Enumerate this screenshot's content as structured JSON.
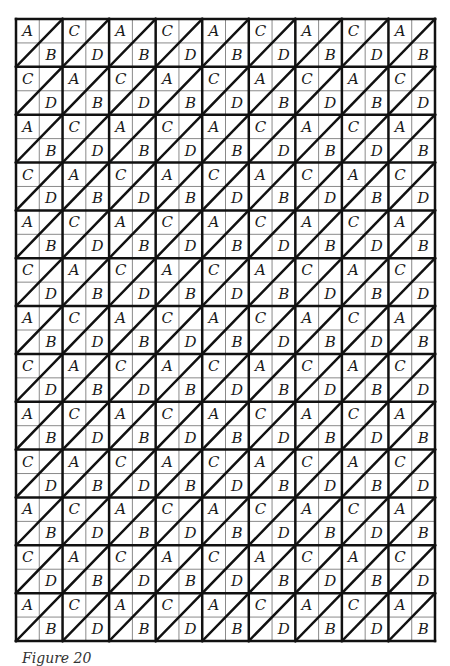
{
  "figure": {
    "caption": "Figure 20",
    "grid": {
      "block_columns": 9,
      "block_rows": 13,
      "cells_per_block": 2,
      "diagonal_direction": "bottom-left-to-top-right",
      "pattern_rule": "block (row,col): A/B when (row+col) even, C/D when odd",
      "letter_pairs": {
        "even": {
          "top_left": "A",
          "bottom_right": "B"
        },
        "odd": {
          "top_left": "C",
          "bottom_right": "D"
        }
      },
      "rows": [
        [
          "A/B",
          "C/D",
          "A/B",
          "C/D",
          "A/B",
          "C/D",
          "A/B",
          "C/D",
          "A/B"
        ],
        [
          "C/D",
          "A/B",
          "C/D",
          "A/B",
          "C/D",
          "A/B",
          "C/D",
          "A/B",
          "C/D"
        ],
        [
          "A/B",
          "C/D",
          "A/B",
          "C/D",
          "A/B",
          "C/D",
          "A/B",
          "C/D",
          "A/B"
        ],
        [
          "C/D",
          "A/B",
          "C/D",
          "A/B",
          "C/D",
          "A/B",
          "C/D",
          "A/B",
          "C/D"
        ],
        [
          "A/B",
          "C/D",
          "A/B",
          "C/D",
          "A/B",
          "C/D",
          "A/B",
          "C/D",
          "A/B"
        ],
        [
          "C/D",
          "A/B",
          "C/D",
          "A/B",
          "C/D",
          "A/B",
          "C/D",
          "A/B",
          "C/D"
        ],
        [
          "A/B",
          "C/D",
          "A/B",
          "C/D",
          "A/B",
          "C/D",
          "A/B",
          "C/D",
          "A/B"
        ],
        [
          "C/D",
          "A/B",
          "C/D",
          "A/B",
          "C/D",
          "A/B",
          "C/D",
          "A/B",
          "C/D"
        ],
        [
          "A/B",
          "C/D",
          "A/B",
          "C/D",
          "A/B",
          "C/D",
          "A/B",
          "C/D",
          "A/B"
        ],
        [
          "C/D",
          "A/B",
          "C/D",
          "A/B",
          "C/D",
          "A/B",
          "C/D",
          "A/B",
          "C/D"
        ],
        [
          "A/B",
          "C/D",
          "A/B",
          "C/D",
          "A/B",
          "C/D",
          "A/B",
          "C/D",
          "A/B"
        ],
        [
          "C/D",
          "A/B",
          "C/D",
          "A/B",
          "C/D",
          "A/B",
          "C/D",
          "A/B",
          "C/D"
        ],
        [
          "A/B",
          "C/D",
          "A/B",
          "C/D",
          "A/B",
          "C/D",
          "A/B",
          "C/D",
          "A/B"
        ]
      ]
    },
    "colors": {
      "background": "#ffffff",
      "thick_line": "#111111",
      "thin_line": "#8a8a8a",
      "letter": "#1a1a1a"
    }
  }
}
